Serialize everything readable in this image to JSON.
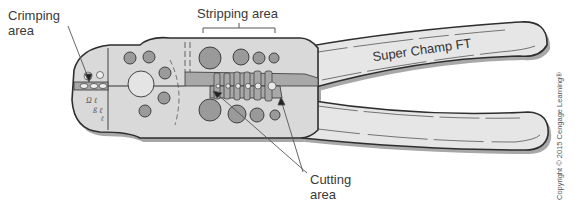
{
  "figure": {
    "labels": {
      "crimping": "Crimping\narea",
      "crimping_line1": "Crimping",
      "crimping_line2": "area",
      "stripping": "Stripping area",
      "cutting_line1": "Cutting",
      "cutting_line2": "area"
    },
    "handle_brand": "Super Champ FT",
    "copyright": "Copyright © 2015 Cengage Learning®",
    "colors": {
      "body_fill": "#d9d9d9",
      "handle_fill": "#e6e6e6",
      "hole_fill": "#9a9a9a",
      "jaw_fill": "#a8a8a8",
      "outline": "#2e2e2e",
      "shadow": "#9c9c9c",
      "leader_line": "#555555"
    }
  }
}
